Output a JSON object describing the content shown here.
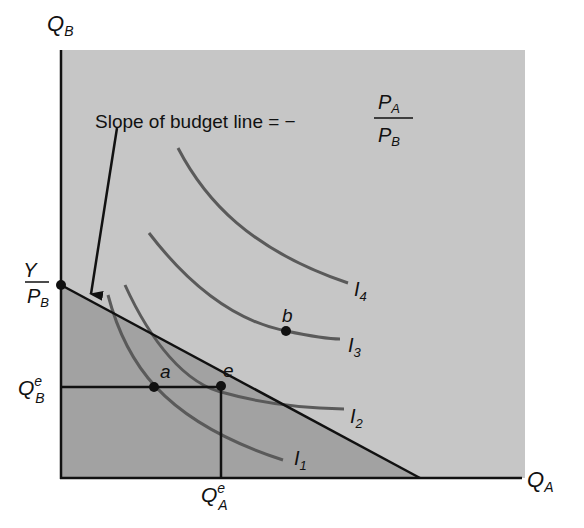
{
  "diagram": {
    "type": "indifference-curve-budget-line",
    "colors": {
      "background": "#ffffff",
      "plot_area": "#c6c6c6",
      "budget_set": "#a2a2a2",
      "curves": "#5a5a5a",
      "lines": "#111111"
    },
    "axes": {
      "y_label": "Q",
      "y_sub": "B",
      "x_label": "Q",
      "x_sub": "A"
    },
    "annotation": {
      "text": "Slope of budget line = −",
      "fraction_num": "P",
      "fraction_num_sub": "A",
      "fraction_den": "P",
      "fraction_den_sub": "B"
    },
    "intercept_label": {
      "num": "Y",
      "den": "P",
      "den_sub": "B"
    },
    "equilibrium_labels": {
      "qb": "Q",
      "qb_sup": "e",
      "qb_sub": "B",
      "qa": "Q",
      "qa_sup": "e",
      "qa_sub": "A"
    },
    "points": [
      {
        "name": "a",
        "label": "a"
      },
      {
        "name": "e",
        "label": "e"
      },
      {
        "name": "b",
        "label": "b"
      }
    ],
    "curves": [
      {
        "name": "I1",
        "label": "I",
        "sub": "1"
      },
      {
        "name": "I2",
        "label": "I",
        "sub": "2"
      },
      {
        "name": "I3",
        "label": "I",
        "sub": "3"
      },
      {
        "name": "I4",
        "label": "I",
        "sub": "4"
      }
    ]
  }
}
